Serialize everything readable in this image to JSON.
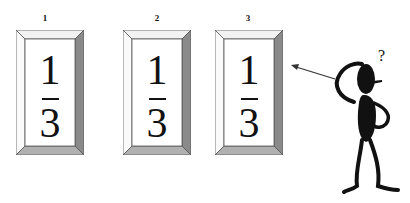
{
  "frames": [
    {
      "label": "1",
      "numerator": "1",
      "denominator": "3"
    },
    {
      "label": "2",
      "numerator": "1",
      "denominator": "3"
    },
    {
      "label": "3",
      "numerator": "1",
      "denominator": "3"
    }
  ],
  "figure": {
    "thought_symbol": "?"
  },
  "colors": {
    "frame_light": "#f4f4f4",
    "frame_dark": "#8a8a8a",
    "frame_bottom": "#b0b0b0",
    "ink": "#111111"
  }
}
